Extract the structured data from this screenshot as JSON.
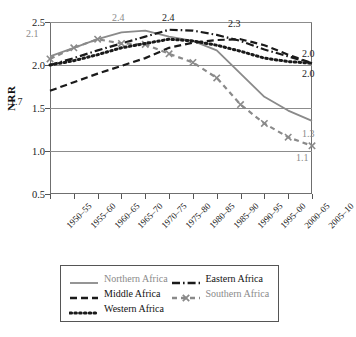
{
  "chart_data": {
    "type": "line",
    "title": "",
    "xlabel": "",
    "ylabel": "NRR",
    "ylim": [
      0.5,
      2.5
    ],
    "yticks": [
      "0.5",
      "1.0",
      "1.5",
      "2.0",
      "2.5"
    ],
    "grid": true,
    "legend_position": "bottom",
    "categories": [
      "1950–55",
      "1955–60",
      "1960–65",
      "1965–70",
      "1970–75",
      "1975–80",
      "1980–85",
      "1985–90",
      "1990–95",
      "1995–00",
      "2000–05",
      "2005–10"
    ],
    "series": [
      {
        "name": "Northern Africa",
        "color": "#8a8a8a",
        "style": "solid",
        "values": [
          2.1,
          2.2,
          2.3,
          2.38,
          2.4,
          2.33,
          2.28,
          2.17,
          1.9,
          1.63,
          1.47,
          1.35
        ]
      },
      {
        "name": "Eastern Africa",
        "color": "#1a1a1a",
        "style": "dashdot",
        "values": [
          2.0,
          2.08,
          2.17,
          2.25,
          2.33,
          2.41,
          2.4,
          2.35,
          2.28,
          2.18,
          2.1,
          2.02
        ]
      },
      {
        "name": "Middle Africa",
        "color": "#1a1a1a",
        "style": "dashed",
        "values": [
          1.7,
          1.8,
          1.9,
          1.99,
          2.08,
          2.2,
          2.26,
          2.29,
          2.3,
          2.23,
          2.12,
          2.02
        ]
      },
      {
        "name": "Southern Africa",
        "color": "#8a8a8a",
        "style": "dashed-x",
        "values": [
          2.07,
          2.2,
          2.3,
          2.25,
          2.24,
          2.13,
          2.03,
          1.85,
          1.54,
          1.32,
          1.16,
          1.06
        ]
      },
      {
        "name": "Western Africa",
        "color": "#1a1a1a",
        "style": "dotted",
        "values": [
          2.0,
          2.05,
          2.12,
          2.2,
          2.25,
          2.3,
          2.28,
          2.23,
          2.16,
          2.08,
          2.04,
          2.02
        ]
      }
    ],
    "annotations": [
      {
        "text": "2.1",
        "color": "gray",
        "x": 26,
        "y": 28
      },
      {
        "text": "2.4",
        "color": "gray",
        "x": 112,
        "y": 12
      },
      {
        "text": "2.4",
        "color": "dark",
        "x": 162,
        "y": 12
      },
      {
        "text": "2.3",
        "color": "dark",
        "x": 228,
        "y": 18
      },
      {
        "text": "1.7",
        "color": "dark",
        "x": 10,
        "y": 96
      },
      {
        "text": "2.0",
        "color": "dark",
        "x": 302,
        "y": 48
      },
      {
        "text": "2.0",
        "color": "dark",
        "x": 302,
        "y": 68
      },
      {
        "text": "1.3",
        "color": "gray",
        "x": 302,
        "y": 128
      },
      {
        "text": "1.1",
        "color": "gray",
        "x": 296,
        "y": 152
      }
    ]
  },
  "legend": {
    "entries": [
      {
        "label": "Northern Africa",
        "tone": "gray"
      },
      {
        "label": "Eastern Africa",
        "tone": "dark"
      },
      {
        "label": "Middle Africa",
        "tone": "dark"
      },
      {
        "label": "Southern Africa",
        "tone": "gray"
      },
      {
        "label": "Western Africa",
        "tone": "dark"
      }
    ]
  }
}
